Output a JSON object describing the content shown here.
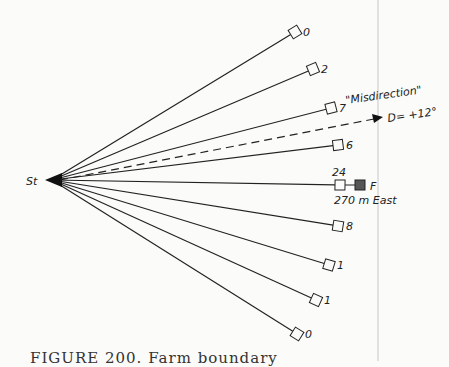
{
  "diagram": {
    "start_label": "St",
    "start": {
      "x": 52,
      "y": 180
    },
    "rays": [
      {
        "label": "0",
        "x": 295,
        "y": 32
      },
      {
        "label": "2",
        "x": 313,
        "y": 69
      },
      {
        "label": "7",
        "x": 331,
        "y": 108
      },
      {
        "label": "6",
        "x": 338,
        "y": 145
      },
      {
        "label": "24",
        "x": 340,
        "y": 185
      },
      {
        "label": "8",
        "x": 338,
        "y": 226
      },
      {
        "label": "1",
        "x": 329,
        "y": 265
      },
      {
        "label": "1",
        "x": 316,
        "y": 300
      },
      {
        "label": "0",
        "x": 297,
        "y": 334
      }
    ],
    "misdirection": {
      "label": "\"Misdirection\"",
      "deviation": "D= +12°",
      "arrow_end": {
        "x": 382,
        "y": 118
      }
    },
    "target": {
      "label": "F",
      "distance": "270 m East",
      "x": 360,
      "y": 185
    }
  },
  "caption": "FIGURE 200. Farm boundary"
}
